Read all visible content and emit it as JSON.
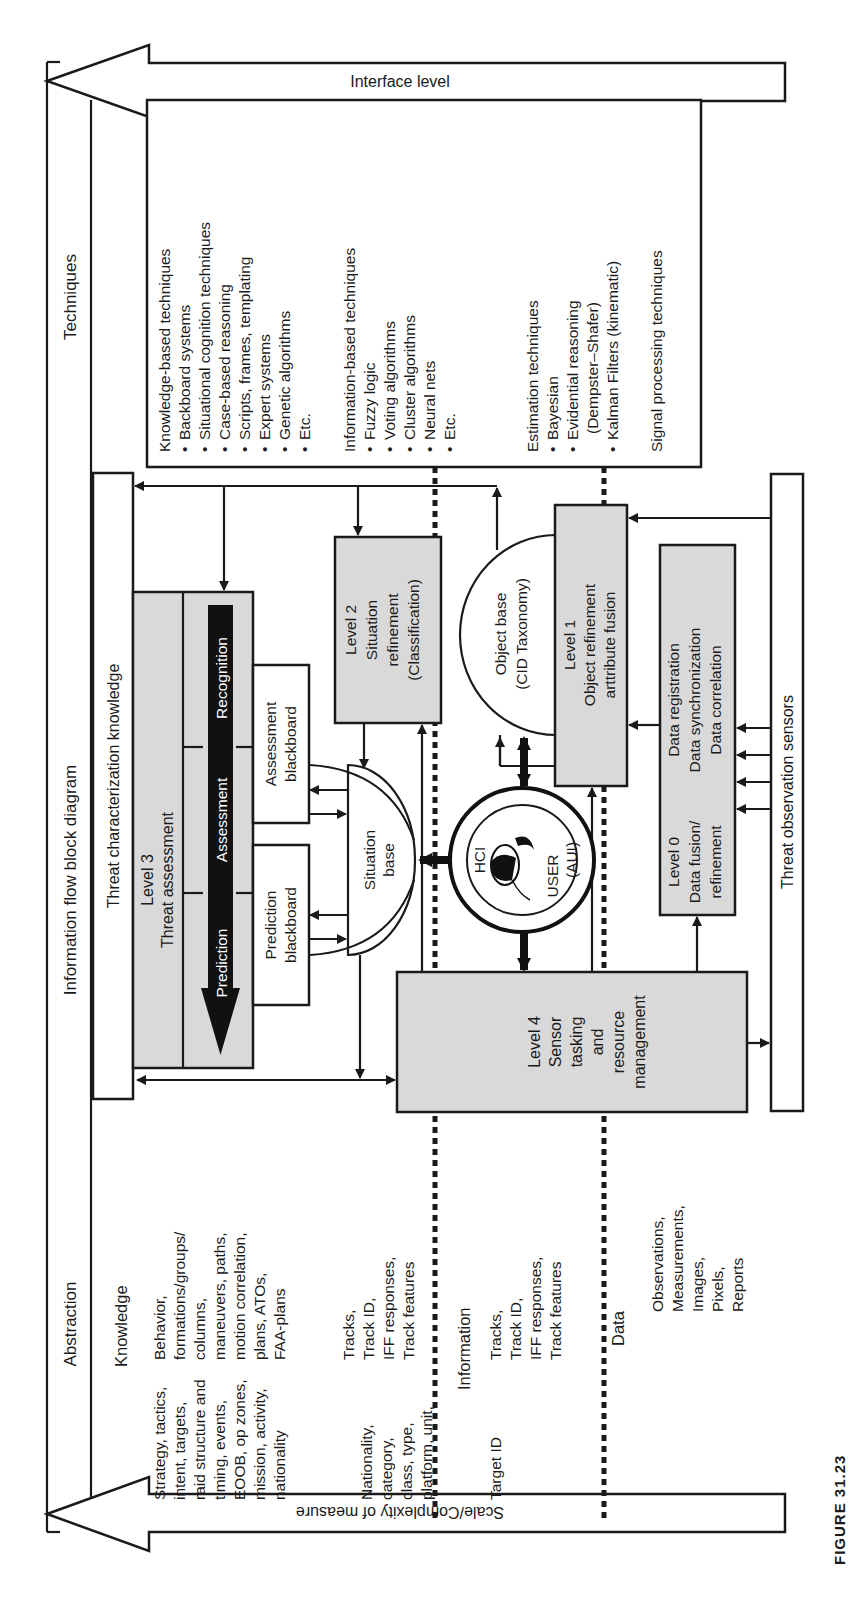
{
  "figure": {
    "caption": "FIGURE 31.23",
    "title": "Information flow block diagram",
    "orientation": "rotated 90 degrees counter-clockwise"
  },
  "axes": {
    "top_arrow": "Interface level",
    "bottom_arrow": "Scale/Complexity of measure",
    "left_column": "Abstraction",
    "right_column": "Techniques"
  },
  "techniques": {
    "knowledge": {
      "heading": "Knowledge-based techniques",
      "items": [
        "Backboard systems",
        "Situational cognition techniques",
        "Case-based reasoning",
        "Scripts, frames, templating",
        "Expert systems",
        "Genetic algorithms",
        "Etc."
      ]
    },
    "information": {
      "heading": "Information-based techniques",
      "items": [
        "Fuzzy logic",
        "Voting algorithms",
        "Cluster algorithms",
        "Neural nets",
        "Etc."
      ]
    },
    "estimation": {
      "heading": "Estimation techniques",
      "items": [
        "Bayesian",
        "Evidential reasoning",
        "(Dempster–Shafer)",
        "Kalman Filters (kinematic)"
      ]
    },
    "signal": "Signal processing techniques"
  },
  "bars": {
    "threat_knowledge": "Threat characterization knowledge",
    "threat_sensors": "Threat observation sensors"
  },
  "blocks": {
    "level3": {
      "line1": "Level 3",
      "line2": "Threat assessment"
    },
    "level3_stages": [
      "Prediction",
      "Assessment",
      "Recognition"
    ],
    "assessment_bb": {
      "line1": "Assessment",
      "line2": "blackboard"
    },
    "prediction_bb": {
      "line1": "Prediction",
      "line2": "blackboard"
    },
    "situation_base": {
      "line1": "Situation",
      "line2": "base"
    },
    "level2": {
      "line1": "Level 2",
      "line2": "Situation",
      "line3": "refinement",
      "line4": "(Classification)"
    },
    "object_base": {
      "line1": "Object base",
      "line2": "(CID Taxonomy)"
    },
    "level1": {
      "line1": "Level 1",
      "line2": "Object refinement",
      "line3": "arttribute fusion"
    },
    "hci": {
      "left": "HCI",
      "mid": "USER",
      "right": "(AUI)"
    },
    "level4": {
      "line1": "Level 4",
      "line2": "Sensor",
      "line3": "tasking",
      "line4": "and",
      "line5": "resource",
      "line6": "management"
    },
    "level0": {
      "line1": "Level 0",
      "line2": "Data fusion/",
      "line3": "refinement"
    },
    "data_proc": {
      "line1": "Data registration",
      "line2": "Data synchronization",
      "line3": "Data correlation"
    }
  },
  "abstraction": {
    "knowledge": {
      "label": "Knowledge",
      "col1": [
        "Strategy, tactics,",
        "intent, targets,",
        "raid structure and",
        "timing, events,",
        "EOOB, op zones,",
        "mission, activity,",
        "nationality"
      ],
      "col2": [
        "Behavior,",
        "formations/groups/",
        "columns,",
        "maneuvers, paths,",
        "motion correlation,",
        "plans, ATOs,",
        "FAA-plans"
      ]
    },
    "knowledge_info": {
      "col1": [
        "Nationality,",
        "category,",
        "class, type,",
        "platform, unit,"
      ],
      "col2": [
        "Tracks,",
        "Track ID,",
        "IFF responses,",
        "Track features"
      ]
    },
    "information": {
      "label": "Information",
      "col1": [
        "Target ID"
      ],
      "col2": [
        "Tracks,",
        "Track ID,",
        "IFF responses,",
        "Track features"
      ]
    },
    "data": {
      "label": "Data",
      "col2": [
        "Observations,",
        "Measurements,",
        "Images,",
        "Pixels,",
        "Reports"
      ]
    }
  },
  "colors": {
    "line": "#1a1a1a",
    "block_fill": "#d9d9d9",
    "stage_bar": "#111111",
    "background": "#ffffff"
  }
}
